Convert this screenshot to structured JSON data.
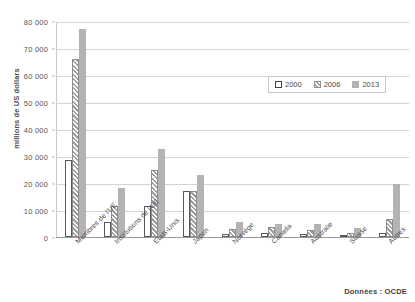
{
  "chart_data": {
    "type": "bar",
    "title": "",
    "xlabel": "",
    "ylabel": "millions de US dollars",
    "ylim": [
      0,
      80000
    ],
    "yticks": [
      0,
      10000,
      20000,
      30000,
      40000,
      50000,
      60000,
      70000,
      80000
    ],
    "ytick_labels": [
      "0",
      "10 000",
      "20 000",
      "30 000",
      "40 000",
      "50 000",
      "60 000",
      "70 000",
      "80 000"
    ],
    "grid": true,
    "legend_position": "upper right",
    "categories": [
      "Membres de l'UE",
      "Institutions de l'UE",
      "Etats-Unis",
      "Japon",
      "Norvège",
      "Canada",
      "Australie",
      "Suisse",
      "Autres"
    ],
    "series": [
      {
        "name": "2000",
        "color": "#ffffff",
        "values": [
          28500,
          5500,
          11500,
          17000,
          1300,
          1400,
          1000,
          900,
          1600
        ]
      },
      {
        "name": "2006",
        "color": "#9f9f9f",
        "values": [
          66000,
          11500,
          25000,
          17200,
          2900,
          3700,
          2500,
          1600,
          6500
        ]
      },
      {
        "name": "2013",
        "color": "#b3b3b3",
        "values": [
          77000,
          18000,
          32500,
          23000,
          5600,
          4900,
          4800,
          3200,
          19500
        ]
      }
    ],
    "annotations": {
      "source": "Données : OCDE"
    }
  }
}
